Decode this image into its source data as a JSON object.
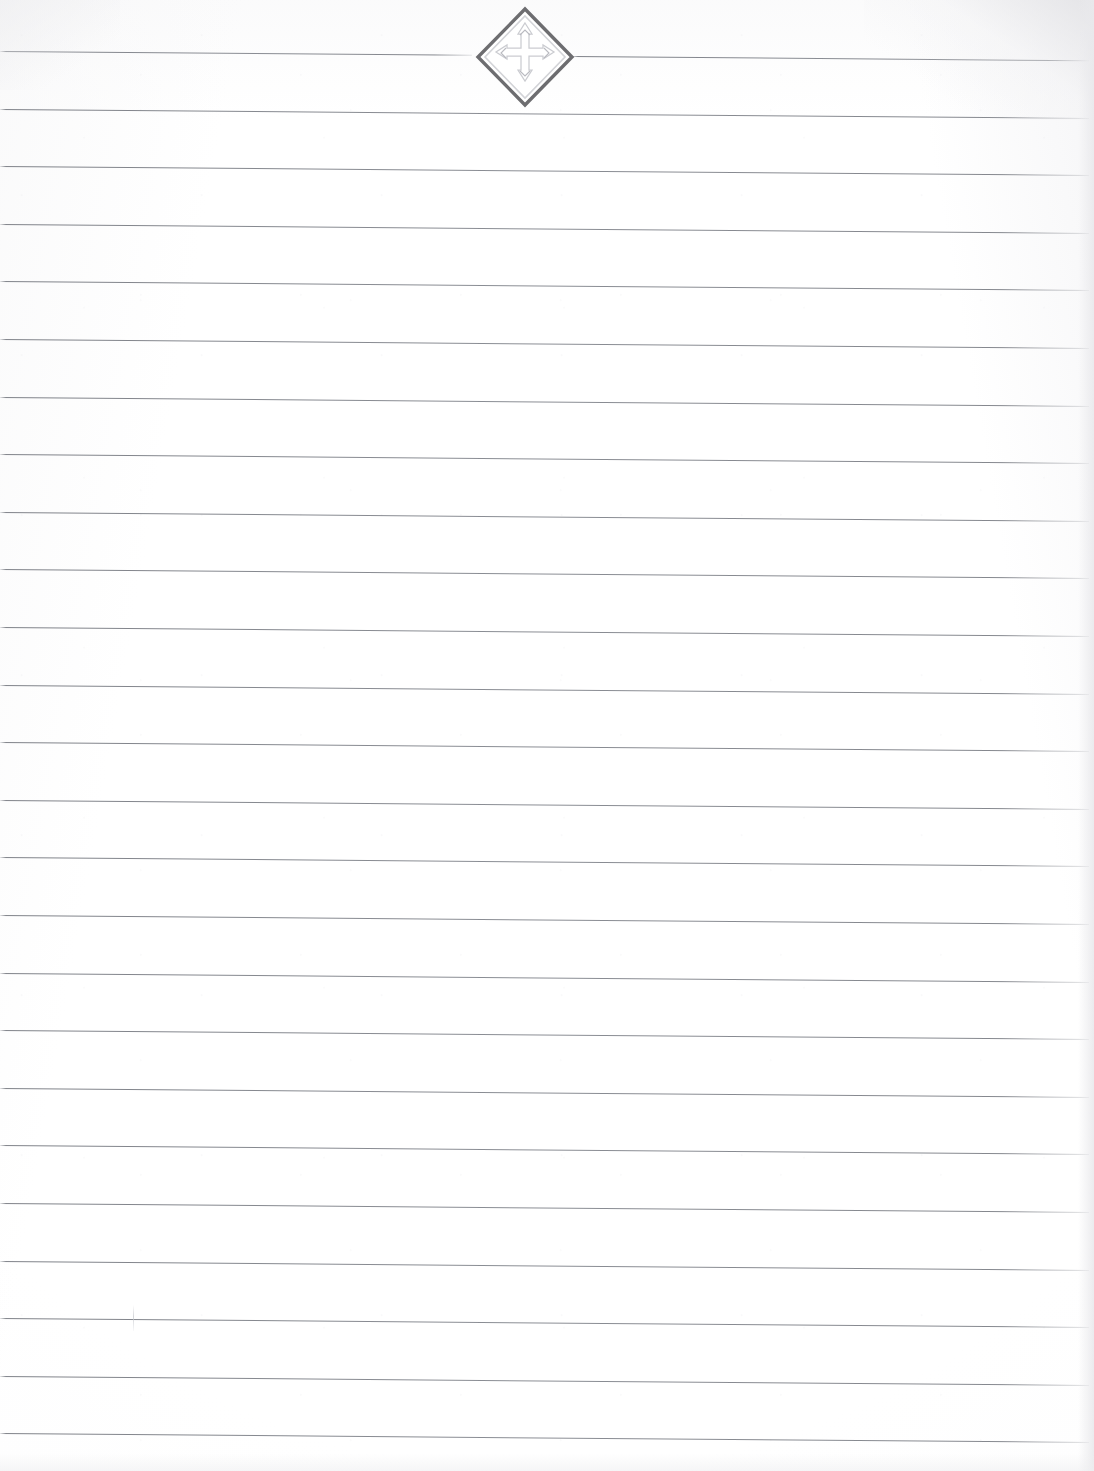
{
  "document": {
    "kind": "scanned-ruled-notepaper",
    "title": "Blank ruled notepaper sheet",
    "page_width": 1094,
    "page_height": 1471,
    "background_color": "#ffffff",
    "has_written_text": false,
    "scan_skew_degrees": 0.47,
    "orientation": "portrait"
  },
  "ruling": {
    "line_color": "#84878e",
    "line_count": 25,
    "line_thickness_px": 1,
    "line_spacing_px": 57.6,
    "first_line_y": 51,
    "left_margin_x": 0,
    "right_end_x": 1089,
    "has_vertical_margin_rule": false,
    "line_y_positions": [
      51,
      108.6,
      166.2,
      223.8,
      281.4,
      339,
      396.6,
      454.2,
      511.8,
      569.4,
      627,
      684.6,
      742.2,
      799.8,
      857.4,
      915,
      972.6,
      1030.2,
      1087.8,
      1145.4,
      1203,
      1260.6,
      1318.2,
      1375.8,
      1433.4
    ]
  },
  "emblem": {
    "name": "diamond-insignia",
    "description": "Embossed diamond-shaped insignia with inner four-pointed cross and outward arrows",
    "position": {
      "x": 474,
      "y": 5,
      "width": 102,
      "height": 104
    },
    "center": {
      "x": 525,
      "y": 57
    },
    "outline_color": "#6d6d70",
    "inner_color": "#c9cace",
    "fill_color": "#ffffff",
    "style": "embossed watermark",
    "interrupts_line_index": 1,
    "gap_start_x": 472,
    "gap_end_x": 572
  },
  "artifacts": {
    "stray_tick": {
      "name": "stray-pen-tick",
      "x": 133,
      "y": 1305,
      "width": 1,
      "height": 26,
      "color": "#c6c8cd"
    },
    "corner_shading": {
      "top_right": "#e2e2e5",
      "top_left": "#ececee",
      "right_edge": "#e9e9ec",
      "bottom_edge": "#eeeef0"
    }
  }
}
